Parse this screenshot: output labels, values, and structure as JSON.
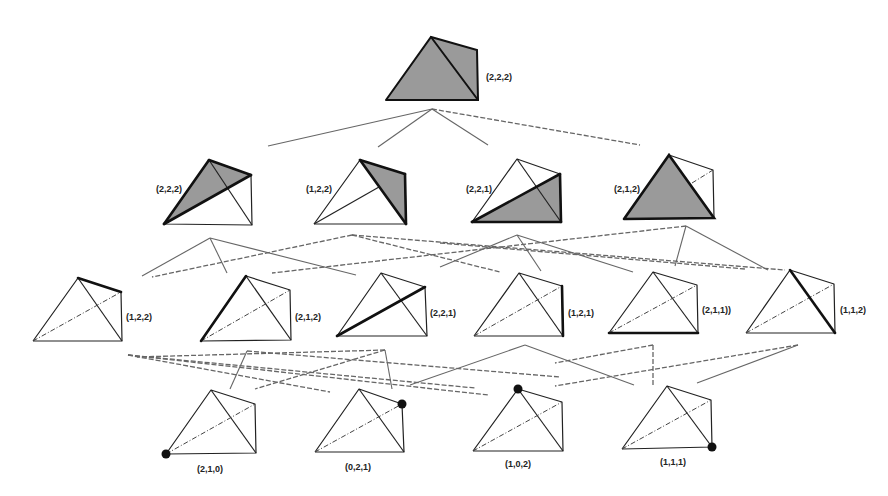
{
  "levels": {
    "level0": {
      "nodes": [
        {
          "label": "(2,2,2)"
        }
      ]
    },
    "level1": {
      "nodes": [
        {
          "label": "(2,2,2)"
        },
        {
          "label": "(1,2,2)"
        },
        {
          "label": "(2,2,1)"
        },
        {
          "label": "(2,1,2)"
        }
      ]
    },
    "level2": {
      "nodes": [
        {
          "label": "(1,2,2)"
        },
        {
          "label": "(2,1,2)"
        },
        {
          "label": "(2,2,1)"
        },
        {
          "label": "(1,2,1)"
        },
        {
          "label": "(2,1,1))"
        },
        {
          "label": "(1,1,2)"
        }
      ]
    },
    "level3": {
      "nodes": [
        {
          "label": "(2,1,0)"
        },
        {
          "label": "(0,2,1)"
        },
        {
          "label": "(1,0,2)"
        },
        {
          "label": "(1,1,1)"
        }
      ]
    }
  },
  "colors": {
    "shaded_face": "#9a9a9a",
    "edge": "#222222",
    "connector": "#666666",
    "background": "#ffffff"
  }
}
